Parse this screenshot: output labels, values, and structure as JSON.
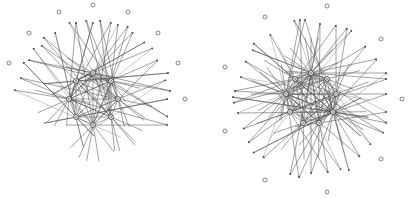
{
  "diagrams": [
    {
      "id": "left",
      "type": "directed-network",
      "inner_nodes": [
        {
          "x": 93,
          "y": 73
        },
        {
          "x": 76,
          "y": 81
        },
        {
          "x": 111,
          "y": 81
        },
        {
          "x": 69,
          "y": 99
        },
        {
          "x": 118,
          "y": 99
        },
        {
          "x": 76,
          "y": 117
        },
        {
          "x": 111,
          "y": 117
        },
        {
          "x": 93,
          "y": 125
        }
      ],
      "outer_nodes": [
        {
          "x": 93,
          "y": 5
        },
        {
          "x": 59,
          "y": 12
        },
        {
          "x": 128,
          "y": 12
        },
        {
          "x": 29,
          "y": 33
        },
        {
          "x": 158,
          "y": 33
        },
        {
          "x": 9,
          "y": 63
        },
        {
          "x": 178,
          "y": 63
        },
        {
          "x": 185,
          "y": 99
        }
      ],
      "arrow_targets": [
        {
          "x": 69,
          "y": 22
        },
        {
          "x": 76,
          "y": 22
        },
        {
          "x": 86,
          "y": 20
        },
        {
          "x": 93,
          "y": 22
        },
        {
          "x": 100,
          "y": 20
        },
        {
          "x": 111,
          "y": 22
        },
        {
          "x": 118,
          "y": 24
        },
        {
          "x": 55,
          "y": 32
        },
        {
          "x": 128,
          "y": 26
        },
        {
          "x": 133,
          "y": 32
        },
        {
          "x": 43,
          "y": 37
        },
        {
          "x": 145,
          "y": 42
        },
        {
          "x": 41,
          "y": 45
        },
        {
          "x": 33,
          "y": 48
        },
        {
          "x": 153,
          "y": 48
        },
        {
          "x": 23,
          "y": 62
        },
        {
          "x": 28,
          "y": 60
        },
        {
          "x": 158,
          "y": 60
        },
        {
          "x": 20,
          "y": 78
        },
        {
          "x": 169,
          "y": 73
        },
        {
          "x": 166,
          "y": 80
        },
        {
          "x": 14,
          "y": 90
        },
        {
          "x": 171,
          "y": 91
        },
        {
          "x": 168,
          "y": 99
        },
        {
          "x": 168,
          "y": 117
        },
        {
          "x": 168,
          "y": 125
        }
      ]
    },
    {
      "id": "right",
      "type": "directed-network",
      "inner_nodes": [
        {
          "x": 311,
          "y": 73
        },
        {
          "x": 295,
          "y": 79
        },
        {
          "x": 327,
          "y": 79
        },
        {
          "x": 286,
          "y": 94
        },
        {
          "x": 336,
          "y": 94
        },
        {
          "x": 290,
          "y": 112
        },
        {
          "x": 333,
          "y": 112
        },
        {
          "x": 303,
          "y": 123
        },
        {
          "x": 319,
          "y": 123
        }
      ],
      "outer_nodes": [
        {
          "x": 327,
          "y": 6
        },
        {
          "x": 265,
          "y": 17
        },
        {
          "x": 381,
          "y": 39
        },
        {
          "x": 225,
          "y": 67
        },
        {
          "x": 402,
          "y": 99
        },
        {
          "x": 225,
          "y": 131
        },
        {
          "x": 381,
          "y": 159
        },
        {
          "x": 265,
          "y": 180
        },
        {
          "x": 327,
          "y": 192
        }
      ],
      "arrow_targets": [
        {
          "x": 294,
          "y": 20
        },
        {
          "x": 300,
          "y": 19
        },
        {
          "x": 305,
          "y": 19
        },
        {
          "x": 320,
          "y": 23
        },
        {
          "x": 336,
          "y": 25
        },
        {
          "x": 347,
          "y": 28
        },
        {
          "x": 352,
          "y": 30
        },
        {
          "x": 270,
          "y": 34
        },
        {
          "x": 253,
          "y": 43
        },
        {
          "x": 252,
          "y": 50
        },
        {
          "x": 366,
          "y": 46
        },
        {
          "x": 245,
          "y": 61
        },
        {
          "x": 377,
          "y": 59
        },
        {
          "x": 240,
          "y": 77
        },
        {
          "x": 387,
          "y": 73
        },
        {
          "x": 387,
          "y": 79
        },
        {
          "x": 234,
          "y": 91
        },
        {
          "x": 232,
          "y": 97
        },
        {
          "x": 233,
          "y": 103
        },
        {
          "x": 387,
          "y": 94
        },
        {
          "x": 237,
          "y": 113
        },
        {
          "x": 387,
          "y": 112
        },
        {
          "x": 243,
          "y": 129
        },
        {
          "x": 387,
          "y": 123
        },
        {
          "x": 248,
          "y": 143
        },
        {
          "x": 384,
          "y": 133
        },
        {
          "x": 253,
          "y": 153
        },
        {
          "x": 371,
          "y": 145
        },
        {
          "x": 263,
          "y": 158
        },
        {
          "x": 360,
          "y": 157
        },
        {
          "x": 290,
          "y": 175
        },
        {
          "x": 299,
          "y": 178
        },
        {
          "x": 311,
          "y": 174
        },
        {
          "x": 328,
          "y": 173
        },
        {
          "x": 341,
          "y": 170
        },
        {
          "x": 349,
          "y": 171
        }
      ]
    }
  ],
  "colors": {
    "edge": "#555555",
    "edge_light": "#9a9a9a",
    "node_stroke": "#444444",
    "outer_node_stroke": "#666666",
    "background": "#ffffff"
  }
}
